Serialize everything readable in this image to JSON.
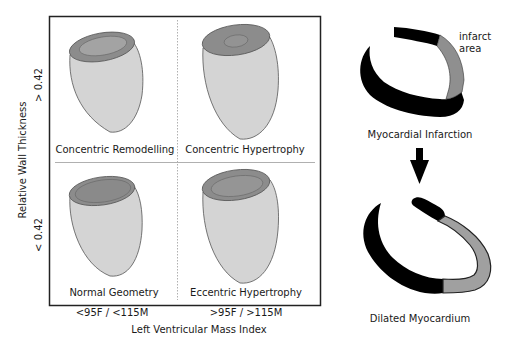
{
  "quadrants": {
    "top_left": {
      "label": "Concentric Remodelling"
    },
    "top_right": {
      "label": "Concentric Hypertrophy"
    },
    "bottom_left": {
      "label": "Normal Geometry"
    },
    "bottom_right": {
      "label": "Eccentric Hypertrophy"
    }
  },
  "y_axis": {
    "title": "Relative Wall Thickness",
    "upper_threshold": "> 0.42",
    "lower_threshold": "< 0.42"
  },
  "x_axis": {
    "title": "Left Ventricular Mass Index",
    "left_threshold": "<95F / <115M",
    "right_threshold": ">95F / >115M"
  },
  "right_panel": {
    "infarct_label_line1": "infarct",
    "infarct_label_line2": "area",
    "mi_caption": "Myocardial Infarction",
    "dilated_caption": "Dilated Myocardium"
  },
  "colors": {
    "ventricle_body": "#d4d4d4",
    "ventricle_top": "#8c8c8c",
    "ventricle_cavity": "#a3a3a3",
    "myocardium": "#000000",
    "infarct": "#8f8f8f",
    "frame": "#222222",
    "divider": "#b0b0b0"
  }
}
